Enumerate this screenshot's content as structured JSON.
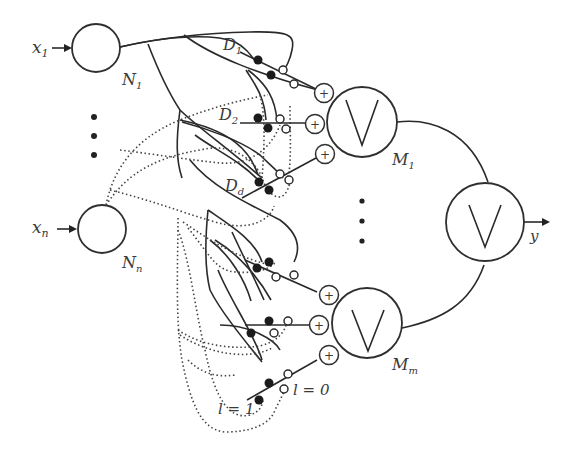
{
  "diagram": {
    "inputs": [
      {
        "label": "x",
        "sub": "1",
        "neuron": "N",
        "neuron_sub": "1"
      },
      {
        "label": "x",
        "sub": "n",
        "neuron": "N",
        "neuron_sub": "n"
      }
    ],
    "dendrites": [
      {
        "label": "D",
        "sub": "1"
      },
      {
        "label": "D",
        "sub": "2"
      },
      {
        "label": "D",
        "sub": "d"
      }
    ],
    "or_units": [
      {
        "label": "M",
        "sub": "1",
        "symbol": "∨"
      },
      {
        "label": "M",
        "sub": "m",
        "symbol": "∨"
      }
    ],
    "output": {
      "symbol": "∨",
      "label": "y"
    },
    "summation_symbol": "+",
    "legend": {
      "l1": "l = 1",
      "l0": "l = 0"
    }
  }
}
